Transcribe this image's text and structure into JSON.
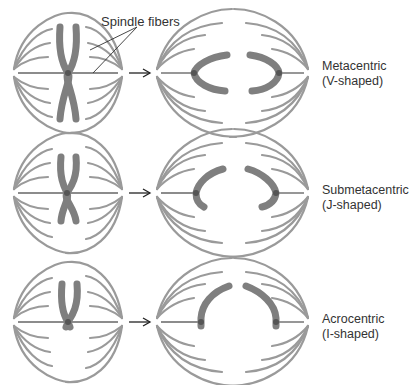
{
  "figure": {
    "callout": "Spindle fibers",
    "colors": {
      "fiber": "#9a9a9a",
      "chromosome": "#7f7f7f",
      "centromere": "#555555",
      "text": "#333333"
    },
    "rows": [
      {
        "type": "Metacentric",
        "shape": "(V-shaped)"
      },
      {
        "type": "Submetacentric",
        "shape": "(J-shaped)"
      },
      {
        "type": "Acrocentric",
        "shape": "(I-shaped)"
      }
    ]
  }
}
